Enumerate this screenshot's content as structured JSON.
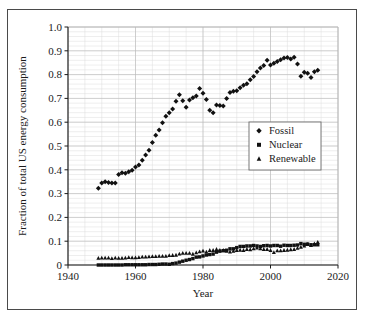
{
  "figure": {
    "background_color": "#ffffff",
    "frame_color": "#4a4a4a",
    "axis_color": "#1a1a1a",
    "grid_major_color": "#b8b8b8",
    "grid_minor_color": "#dcdcdc",
    "marker_color": "#111111"
  },
  "chart_data": {
    "type": "scatter",
    "title": "",
    "subtitle": "",
    "xlabel": "Year",
    "ylabel": "Fraction of total US energy consumption",
    "xlim": [
      1940,
      2020
    ],
    "ylim": [
      0,
      1.0
    ],
    "xticks": [
      1940,
      1960,
      1980,
      2000,
      2020
    ],
    "xtick_labels": [
      "1940",
      "1960",
      "1980",
      "2000",
      "2020"
    ],
    "yticks": [
      0,
      0.1,
      0.2,
      0.3,
      0.4,
      0.5,
      0.6,
      0.7,
      0.8,
      0.9,
      1.0
    ],
    "ytick_labels": [
      "0",
      "0.1",
      "0.2",
      "0.3",
      "0.4",
      "0.5",
      "0.6",
      "0.7",
      "0.8",
      "0.9",
      "1.0"
    ],
    "x_minor_step": 5,
    "y_minor_step": 0.02,
    "grid": true,
    "legend_position": "center-right",
    "x": [
      1949,
      1950,
      1951,
      1952,
      1953,
      1954,
      1955,
      1956,
      1957,
      1958,
      1959,
      1960,
      1961,
      1962,
      1963,
      1964,
      1965,
      1966,
      1967,
      1968,
      1969,
      1970,
      1971,
      1972,
      1973,
      1974,
      1975,
      1976,
      1977,
      1978,
      1979,
      1980,
      1981,
      1982,
      1983,
      1984,
      1985,
      1986,
      1987,
      1988,
      1989,
      1990,
      1991,
      1992,
      1993,
      1994,
      1995,
      1996,
      1997,
      1998,
      1999,
      2000,
      2001,
      2002,
      2003,
      2004,
      2005,
      2006,
      2007,
      2008,
      2009,
      2010,
      2011,
      2012,
      2013,
      2014
    ],
    "series": [
      {
        "name": "Fossil",
        "marker": "diamond",
        "color": "#111111",
        "values": [
          0.322,
          0.345,
          0.35,
          0.347,
          0.345,
          0.345,
          0.38,
          0.388,
          0.385,
          0.392,
          0.398,
          0.412,
          0.42,
          0.44,
          0.462,
          0.482,
          0.515,
          0.545,
          0.567,
          0.598,
          0.625,
          0.64,
          0.655,
          0.688,
          0.715,
          0.69,
          0.663,
          0.693,
          0.703,
          0.71,
          0.742,
          0.722,
          0.695,
          0.65,
          0.64,
          0.672,
          0.67,
          0.668,
          0.7,
          0.725,
          0.73,
          0.732,
          0.745,
          0.755,
          0.762,
          0.778,
          0.792,
          0.812,
          0.828,
          0.838,
          0.86,
          0.84,
          0.848,
          0.855,
          0.862,
          0.87,
          0.872,
          0.866,
          0.873,
          0.845,
          0.793,
          0.81,
          0.806,
          0.788,
          0.812,
          0.818
        ]
      },
      {
        "name": "Nuclear",
        "marker": "square",
        "color": "#111111",
        "values": [
          0.0,
          0.0,
          0.0,
          0.0,
          0.0,
          0.0,
          0.0,
          0.0,
          0.001,
          0.001,
          0.001,
          0.001,
          0.001,
          0.001,
          0.001,
          0.002,
          0.002,
          0.002,
          0.003,
          0.004,
          0.004,
          0.003,
          0.006,
          0.008,
          0.012,
          0.016,
          0.02,
          0.023,
          0.027,
          0.033,
          0.034,
          0.038,
          0.042,
          0.044,
          0.046,
          0.054,
          0.058,
          0.06,
          0.062,
          0.068,
          0.068,
          0.073,
          0.078,
          0.078,
          0.08,
          0.08,
          0.082,
          0.08,
          0.078,
          0.081,
          0.082,
          0.08,
          0.082,
          0.082,
          0.079,
          0.083,
          0.082,
          0.082,
          0.083,
          0.084,
          0.09,
          0.087,
          0.088,
          0.085,
          0.085,
          0.085
        ]
      },
      {
        "name": "Renewable",
        "marker": "triangle",
        "color": "#111111",
        "values": [
          0.029,
          0.03,
          0.03,
          0.03,
          0.028,
          0.03,
          0.029,
          0.029,
          0.03,
          0.032,
          0.031,
          0.031,
          0.032,
          0.034,
          0.034,
          0.035,
          0.036,
          0.036,
          0.037,
          0.037,
          0.037,
          0.04,
          0.041,
          0.042,
          0.047,
          0.05,
          0.05,
          0.05,
          0.046,
          0.052,
          0.056,
          0.059,
          0.055,
          0.062,
          0.062,
          0.066,
          0.062,
          0.062,
          0.058,
          0.055,
          0.058,
          0.062,
          0.063,
          0.062,
          0.066,
          0.065,
          0.069,
          0.072,
          0.069,
          0.066,
          0.066,
          0.062,
          0.053,
          0.06,
          0.06,
          0.062,
          0.063,
          0.065,
          0.066,
          0.071,
          0.075,
          0.08,
          0.087,
          0.082,
          0.09,
          0.096
        ]
      }
    ]
  },
  "legend": {
    "entries": [
      {
        "label": "Fossil",
        "marker": "diamond"
      },
      {
        "label": "Nuclear",
        "marker": "square"
      },
      {
        "label": "Renewable",
        "marker": "triangle"
      }
    ]
  }
}
